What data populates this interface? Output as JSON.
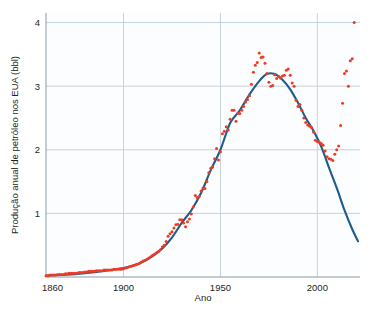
{
  "chart_data": {
    "type": "scatter",
    "title": "",
    "subtitle": "",
    "xlabel": "Ano",
    "ylabel": "Produção anual de petróleo nos EUA (bbl)",
    "xlim": [
      1860,
      2022
    ],
    "ylim": [
      0,
      4.15
    ],
    "xticks": [
      1860,
      1900,
      1950,
      2000
    ],
    "xticklabels": [
      "1860",
      "1900",
      "1950",
      "2000"
    ],
    "yticks": [
      1,
      2,
      3,
      4
    ],
    "yticklabels": [
      "1",
      "2",
      "3",
      "4"
    ],
    "grid": "horizontal-and-vertical-light",
    "legend": "none",
    "colors": {
      "points": "#ee3b24",
      "curve": "#1f5c8b",
      "grid": "#c8d2da",
      "axis": "#8a9aa6",
      "background": "#ffffff",
      "plot_background": "#fbfdfe",
      "text": "#231f20"
    },
    "series": [
      {
        "name": "Produção anual observada",
        "type": "scatter",
        "marker": "circle",
        "color": "#ee3b24",
        "points": [
          [
            1860,
            0.02
          ],
          [
            1861,
            0.02
          ],
          [
            1862,
            0.03
          ],
          [
            1863,
            0.03
          ],
          [
            1864,
            0.03
          ],
          [
            1865,
            0.03
          ],
          [
            1866,
            0.04
          ],
          [
            1867,
            0.04
          ],
          [
            1868,
            0.04
          ],
          [
            1869,
            0.04
          ],
          [
            1870,
            0.05
          ],
          [
            1871,
            0.05
          ],
          [
            1872,
            0.06
          ],
          [
            1873,
            0.06
          ],
          [
            1874,
            0.06
          ],
          [
            1875,
            0.06
          ],
          [
            1876,
            0.06
          ],
          [
            1877,
            0.07
          ],
          [
            1878,
            0.07
          ],
          [
            1879,
            0.07
          ],
          [
            1880,
            0.08
          ],
          [
            1881,
            0.08
          ],
          [
            1882,
            0.09
          ],
          [
            1883,
            0.09
          ],
          [
            1884,
            0.09
          ],
          [
            1885,
            0.09
          ],
          [
            1886,
            0.1
          ],
          [
            1887,
            0.1
          ],
          [
            1888,
            0.1
          ],
          [
            1889,
            0.1
          ],
          [
            1890,
            0.11
          ],
          [
            1891,
            0.11
          ],
          [
            1892,
            0.11
          ],
          [
            1893,
            0.11
          ],
          [
            1894,
            0.11
          ],
          [
            1895,
            0.12
          ],
          [
            1896,
            0.12
          ],
          [
            1897,
            0.12
          ],
          [
            1898,
            0.12
          ],
          [
            1899,
            0.12
          ],
          [
            1900,
            0.13
          ],
          [
            1901,
            0.14
          ],
          [
            1902,
            0.15
          ],
          [
            1903,
            0.16
          ],
          [
            1904,
            0.17
          ],
          [
            1905,
            0.18
          ],
          [
            1906,
            0.19
          ],
          [
            1907,
            0.2
          ],
          [
            1908,
            0.21
          ],
          [
            1909,
            0.23
          ],
          [
            1910,
            0.25
          ],
          [
            1911,
            0.26
          ],
          [
            1912,
            0.28
          ],
          [
            1913,
            0.3
          ],
          [
            1914,
            0.32
          ],
          [
            1915,
            0.34
          ],
          [
            1916,
            0.36
          ],
          [
            1917,
            0.38
          ],
          [
            1918,
            0.4
          ],
          [
            1919,
            0.43
          ],
          [
            1920,
            0.47
          ],
          [
            1921,
            0.5
          ],
          [
            1922,
            0.56
          ],
          [
            1923,
            0.64
          ],
          [
            1924,
            0.68
          ],
          [
            1925,
            0.71
          ],
          [
            1926,
            0.77
          ],
          [
            1927,
            0.82
          ],
          [
            1928,
            0.83
          ],
          [
            1929,
            0.9
          ],
          [
            1930,
            0.9
          ],
          [
            1931,
            0.85
          ],
          [
            1932,
            0.79
          ],
          [
            1933,
            0.87
          ],
          [
            1934,
            0.91
          ],
          [
            1935,
            0.99
          ],
          [
            1936,
            1.1
          ],
          [
            1937,
            1.28
          ],
          [
            1938,
            1.25
          ],
          [
            1939,
            1.26
          ],
          [
            1940,
            1.35
          ],
          [
            1941,
            1.4
          ],
          [
            1942,
            1.39
          ],
          [
            1943,
            1.5
          ],
          [
            1944,
            1.64
          ],
          [
            1945,
            1.71
          ],
          [
            1946,
            1.73
          ],
          [
            1947,
            1.86
          ],
          [
            1948,
            2.02
          ],
          [
            1949,
            1.84
          ],
          [
            1950,
            1.97
          ],
          [
            1951,
            2.25
          ],
          [
            1952,
            2.29
          ],
          [
            1953,
            2.36
          ],
          [
            1954,
            2.31
          ],
          [
            1955,
            2.48
          ],
          [
            1956,
            2.62
          ],
          [
            1957,
            2.62
          ],
          [
            1958,
            2.45
          ],
          [
            1959,
            2.57
          ],
          [
            1960,
            2.57
          ],
          [
            1961,
            2.62
          ],
          [
            1962,
            2.68
          ],
          [
            1963,
            2.75
          ],
          [
            1964,
            2.79
          ],
          [
            1965,
            2.85
          ],
          [
            1966,
            3.03
          ],
          [
            1967,
            3.22
          ],
          [
            1968,
            3.33
          ],
          [
            1969,
            3.37
          ],
          [
            1970,
            3.52
          ],
          [
            1971,
            3.45
          ],
          [
            1972,
            3.46
          ],
          [
            1973,
            3.36
          ],
          [
            1974,
            3.2
          ],
          [
            1975,
            3.06
          ],
          [
            1976,
            3.0
          ],
          [
            1977,
            3.01
          ],
          [
            1978,
            3.18
          ],
          [
            1979,
            3.12
          ],
          [
            1980,
            3.15
          ],
          [
            1981,
            3.13
          ],
          [
            1982,
            3.16
          ],
          [
            1983,
            3.17
          ],
          [
            1984,
            3.25
          ],
          [
            1985,
            3.27
          ],
          [
            1986,
            3.17
          ],
          [
            1987,
            3.05
          ],
          [
            1988,
            3.0
          ],
          [
            1989,
            2.78
          ],
          [
            1990,
            2.68
          ],
          [
            1991,
            2.71
          ],
          [
            1992,
            2.62
          ],
          [
            1993,
            2.5
          ],
          [
            1994,
            2.43
          ],
          [
            1995,
            2.39
          ],
          [
            1996,
            2.37
          ],
          [
            1997,
            2.35
          ],
          [
            1998,
            2.28
          ],
          [
            1999,
            2.15
          ],
          [
            2000,
            2.13
          ],
          [
            2001,
            2.12
          ],
          [
            2002,
            2.1
          ],
          [
            2003,
            2.07
          ],
          [
            2004,
            1.98
          ],
          [
            2005,
            1.89
          ],
          [
            2006,
            1.86
          ],
          [
            2007,
            1.85
          ],
          [
            2008,
            1.83
          ],
          [
            2009,
            1.93
          ],
          [
            2010,
            2.0
          ],
          [
            2011,
            2.06
          ],
          [
            2012,
            2.38
          ],
          [
            2013,
            2.73
          ],
          [
            2014,
            3.2
          ],
          [
            2015,
            3.24
          ],
          [
            2016,
            3.0
          ],
          [
            2017,
            3.4
          ],
          [
            2018,
            3.43
          ],
          [
            2019,
            4.0
          ]
        ]
      },
      {
        "name": "Curva de Hubbert ajustada",
        "type": "line",
        "color": "#1f5c8b",
        "points": [
          [
            1860,
            0.02
          ],
          [
            1870,
            0.035
          ],
          [
            1880,
            0.06
          ],
          [
            1890,
            0.095
          ],
          [
            1900,
            0.14
          ],
          [
            1905,
            0.18
          ],
          [
            1910,
            0.24
          ],
          [
            1915,
            0.33
          ],
          [
            1920,
            0.45
          ],
          [
            1925,
            0.62
          ],
          [
            1930,
            0.85
          ],
          [
            1935,
            1.05
          ],
          [
            1940,
            1.32
          ],
          [
            1945,
            1.68
          ],
          [
            1950,
            2.0
          ],
          [
            1955,
            2.42
          ],
          [
            1960,
            2.62
          ],
          [
            1965,
            2.87
          ],
          [
            1970,
            3.08
          ],
          [
            1974,
            3.19
          ],
          [
            1978,
            3.19
          ],
          [
            1982,
            3.1
          ],
          [
            1986,
            2.95
          ],
          [
            1990,
            2.74
          ],
          [
            1994,
            2.5
          ],
          [
            1998,
            2.3
          ],
          [
            2002,
            2.05
          ],
          [
            2006,
            1.72
          ],
          [
            2010,
            1.4
          ],
          [
            2014,
            1.05
          ],
          [
            2018,
            0.75
          ],
          [
            2021,
            0.56
          ]
        ]
      }
    ],
    "annotations": [
      "Pontos observados em vermelho; curva de Hubbert ajustada em azul",
      "Pico da curva ajustada por volta de 1974 em cerca de 3,2 bbl",
      "Pontos após 2010 sobem acima da curva ajustada, atingindo cerca de 4,0 bbl"
    ]
  }
}
